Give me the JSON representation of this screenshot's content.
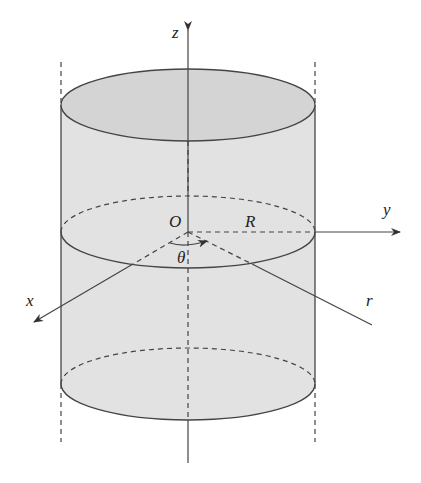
{
  "diagram": {
    "labels": {
      "z": "z",
      "y": "y",
      "x": "x",
      "r": "r",
      "origin": "O",
      "radius": "R",
      "angle": "θ"
    },
    "colors": {
      "fill": "#e2e2e2",
      "top_fill": "#d4d4d4",
      "stroke": "#333333"
    }
  }
}
